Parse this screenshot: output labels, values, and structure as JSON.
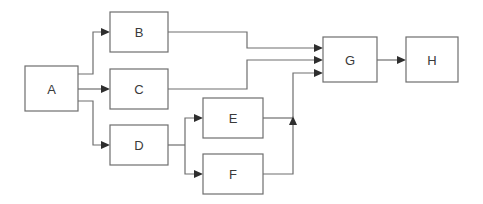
{
  "diagram": {
    "type": "flowchart",
    "nodes": [
      {
        "id": "A",
        "label": "A",
        "x": 25,
        "y": 66,
        "w": 53,
        "h": 45
      },
      {
        "id": "B",
        "label": "B",
        "x": 110,
        "y": 12,
        "w": 58,
        "h": 40
      },
      {
        "id": "C",
        "label": "C",
        "x": 110,
        "y": 69,
        "w": 58,
        "h": 40
      },
      {
        "id": "D",
        "label": "D",
        "x": 110,
        "y": 125,
        "w": 58,
        "h": 40
      },
      {
        "id": "E",
        "label": "E",
        "x": 203,
        "y": 98,
        "w": 60,
        "h": 40
      },
      {
        "id": "F",
        "label": "F",
        "x": 203,
        "y": 154,
        "w": 60,
        "h": 40
      },
      {
        "id": "G",
        "label": "G",
        "x": 323,
        "y": 37,
        "w": 54,
        "h": 45
      },
      {
        "id": "H",
        "label": "H",
        "x": 406,
        "y": 37,
        "w": 52,
        "h": 45
      }
    ],
    "edges": [
      {
        "from": "A",
        "to": "B"
      },
      {
        "from": "A",
        "to": "C"
      },
      {
        "from": "A",
        "to": "D"
      },
      {
        "from": "D",
        "to": "E"
      },
      {
        "from": "D",
        "to": "F"
      },
      {
        "from": "B",
        "to": "G"
      },
      {
        "from": "C",
        "to": "G"
      },
      {
        "from": "E",
        "to": "G"
      },
      {
        "from": "F",
        "to": "G"
      },
      {
        "from": "G",
        "to": "H"
      }
    ],
    "colors": {
      "stroke": "#6e6e6e",
      "arrowhead": "#2e2e2e",
      "text": "#3a3a3a",
      "background": "#ffffff"
    }
  }
}
